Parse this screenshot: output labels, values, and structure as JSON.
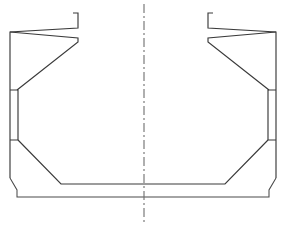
{
  "document": {
    "kind": "technical-line-drawing",
    "title": "Symmetrical Cross-Section Outline",
    "description": "Mirror-symmetric structural cross-section with vertical dash-dot centre line, sloped upper flanges, narrow side panels and chamfered lower corners.",
    "background_color": "#ffffff",
    "line_color": "#3a3a3a",
    "centerline_color": "#6e6e6e",
    "canvas": {
      "width": 286,
      "height": 234
    }
  },
  "centerline": {
    "label": "centre line",
    "x": 144,
    "y_top": 4,
    "y_bottom": 222,
    "dash_pattern": "9 3 2 3",
    "color": "#6e6e6e"
  },
  "geometry": {
    "left_outer_profile": "M 10,178 L 10,32 L 78,28 L 78,13 L 73,13",
    "left_upper_inner": "M 10,32 L 78,38 L 78,42 L 17,90",
    "left_side_panel": "M 10,90 L 18,90 L 18,140 L 10,140",
    "left_lower_inner": "M 18,140 L 61,184 L 144,184",
    "left_outer_lower": "M 10,178 L 17,190 L 17,197 L 144,197",
    "right_outer_profile": "M 276,178 L 276,32 L 208,28 L 208,13 L 213,13",
    "right_upper_inner": "M 276,32 L 208,38 L 208,42 L 269,90",
    "right_side_panel": "M 276,90 L 268,90 L 268,140 L 276,140",
    "right_lower_inner": "M 268,140 L 225,184 L 144,184",
    "right_outer_lower": "M 276,178 L 269,190 L 269,197 L 144,197"
  },
  "features": [
    {
      "name": "upper-flange-left",
      "side": "left",
      "description": "sloped upper flange with end notch"
    },
    {
      "name": "upper-flange-right",
      "side": "right",
      "description": "sloped upper flange with end notch"
    },
    {
      "name": "side-panel-left",
      "side": "left",
      "description": "narrow vertical side panel strip"
    },
    {
      "name": "side-panel-right",
      "side": "right",
      "description": "narrow vertical side panel strip"
    },
    {
      "name": "bilge-chamfer-left",
      "side": "left",
      "description": "lower diagonal chamfer to flat bottom"
    },
    {
      "name": "bilge-chamfer-right",
      "side": "right",
      "description": "lower diagonal chamfer to flat bottom"
    },
    {
      "name": "flat-bottom",
      "side": "center",
      "description": "inner flat bottom line"
    },
    {
      "name": "outer-shell-bottom",
      "side": "center",
      "description": "outer shell bottom line with corner chamfers"
    }
  ]
}
